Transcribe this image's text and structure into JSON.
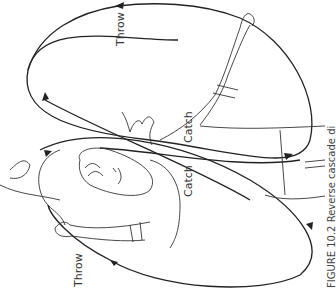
{
  "figure": {
    "orientation": "rotated 90 degrees counter-clockwise",
    "labels": {
      "throw_top": "Throw",
      "throw_bottom": "Throw",
      "catch_right": "Catch",
      "catch_left": "Catch"
    },
    "caption": "FIGURE 10.2  Reverse cascade di",
    "colors": {
      "line": "#222222",
      "background": "#ffffff"
    }
  }
}
